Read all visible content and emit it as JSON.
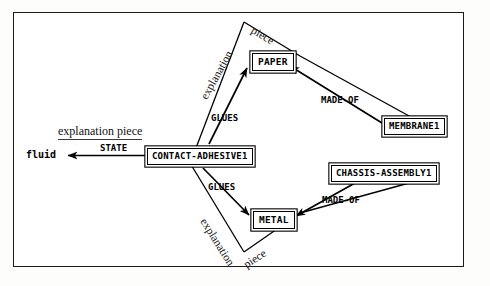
{
  "figure": {
    "kind": "semantic-network-diagram",
    "caption_partial": ""
  },
  "nodes": [
    {
      "id": "paper",
      "label": "PAPER",
      "type": "boxed"
    },
    {
      "id": "membrane",
      "label": "MEMBRANE1",
      "type": "boxed"
    },
    {
      "id": "adhesive",
      "label": "CONTACT-ADHESIVE1",
      "type": "boxed"
    },
    {
      "id": "chassis",
      "label": "CHASSIS-ASSEMBLY1",
      "type": "boxed"
    },
    {
      "id": "metal",
      "label": "METAL",
      "type": "boxed"
    },
    {
      "id": "fluid",
      "label": "fluid",
      "type": "plain"
    }
  ],
  "relations": [
    {
      "id": "state",
      "label": "STATE",
      "from": "adhesive",
      "to": "fluid"
    },
    {
      "id": "glues_up",
      "label": "GLUES",
      "from": "adhesive",
      "to": "paper"
    },
    {
      "id": "glues_down",
      "label": "GLUES",
      "from": "adhesive",
      "to": "metal"
    },
    {
      "id": "madeof_up",
      "label": "MADE-OF",
      "from": "membrane",
      "to": "paper"
    },
    {
      "id": "madeof_down",
      "label": "MADE-OF",
      "from": "chassis",
      "to": "metal"
    }
  ],
  "annotations": [
    {
      "id": "annot_state",
      "text": "explanation piece",
      "style": "underlined-horizontal"
    },
    {
      "id": "annot_top_expl",
      "text": "explanation",
      "style": "rotated-up"
    },
    {
      "id": "annot_top_piece",
      "text": "piece",
      "style": "rotated-down"
    },
    {
      "id": "annot_bot_expl",
      "text": "explanation",
      "style": "rotated-down"
    },
    {
      "id": "annot_bot_piece",
      "text": "piece",
      "style": "rotated-down"
    }
  ],
  "colors": {
    "ink": "#000000",
    "frame": "#1b1b1b",
    "paper": "#ffffff",
    "annotation": "#111111"
  }
}
